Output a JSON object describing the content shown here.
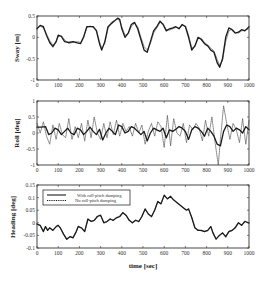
{
  "chart_data": [
    {
      "type": "line",
      "panel": "sway",
      "ylabel": "Sway  [m]",
      "xlabel": "",
      "xlim": [
        0,
        1000
      ],
      "ylim": [
        -1,
        0.5
      ],
      "xticks": [
        0,
        100,
        200,
        300,
        400,
        500,
        600,
        700,
        800,
        900,
        1000
      ],
      "yticks": [
        0.5,
        0,
        -0.5,
        -1
      ],
      "ytick_labels": [
        "0.5",
        "0",
        "-0.5",
        "-1"
      ],
      "grid": false,
      "series": [
        {
          "name": "With roll-pitch damping",
          "style": "solid",
          "x": [
            0,
            15,
            30,
            45,
            60,
            75,
            90,
            100,
            115,
            130,
            150,
            170,
            190,
            205,
            220,
            235,
            250,
            265,
            280,
            295,
            305,
            320,
            335,
            350,
            365,
            380,
            390,
            400,
            415,
            430,
            445,
            460,
            475,
            490,
            505,
            520,
            535,
            550,
            565,
            580,
            595,
            610,
            625,
            640,
            655,
            670,
            685,
            700,
            715,
            730,
            745,
            760,
            775,
            790,
            805,
            820,
            835,
            850,
            862,
            875,
            890,
            905,
            920,
            935,
            950,
            965,
            980,
            1000
          ],
          "y": [
            0.2,
            0.28,
            0.25,
            0.05,
            -0.12,
            -0.22,
            -0.1,
            0.05,
            0.02,
            -0.1,
            -0.12,
            -0.1,
            -0.13,
            -0.15,
            0.0,
            0.25,
            0.25,
            0.25,
            0.15,
            -0.15,
            -0.3,
            -0.1,
            0.25,
            0.32,
            0.38,
            0.45,
            0.42,
            0.2,
            0.0,
            0.1,
            0.3,
            0.35,
            0.2,
            -0.05,
            -0.3,
            -0.35,
            -0.1,
            0.15,
            0.25,
            0.38,
            0.3,
            0.15,
            0.2,
            0.22,
            0.25,
            0.2,
            0.3,
            0.25,
            0.0,
            -0.3,
            -0.2,
            0.0,
            -0.05,
            -0.15,
            -0.2,
            -0.3,
            -0.35,
            -0.6,
            -0.7,
            -0.5,
            0.0,
            0.22,
            0.18,
            0.1,
            0.12,
            0.18,
            0.15,
            0.25
          ]
        },
        {
          "name": "No roll-pitch damping",
          "style": "dotted",
          "x": [
            0,
            15,
            30,
            45,
            60,
            75,
            90,
            100,
            115,
            130,
            150,
            170,
            190,
            205,
            220,
            235,
            250,
            265,
            280,
            295,
            305,
            320,
            335,
            350,
            365,
            380,
            390,
            400,
            415,
            430,
            445,
            460,
            475,
            490,
            505,
            520,
            535,
            550,
            565,
            580,
            595,
            610,
            625,
            640,
            655,
            670,
            685,
            700,
            715,
            730,
            745,
            760,
            775,
            790,
            805,
            820,
            835,
            850,
            862,
            875,
            890,
            905,
            920,
            935,
            950,
            965,
            980,
            1000
          ],
          "y": [
            0.22,
            0.26,
            0.22,
            0.08,
            -0.08,
            -0.18,
            -0.12,
            0.02,
            0.04,
            -0.06,
            -0.14,
            -0.12,
            -0.1,
            -0.12,
            0.02,
            0.22,
            0.27,
            0.23,
            0.18,
            -0.1,
            -0.25,
            -0.15,
            0.2,
            0.35,
            0.4,
            0.42,
            0.4,
            0.25,
            0.05,
            0.08,
            0.25,
            0.33,
            0.25,
            0.0,
            -0.22,
            -0.3,
            -0.15,
            0.1,
            0.22,
            0.35,
            0.32,
            0.18,
            0.17,
            0.2,
            0.23,
            0.22,
            0.28,
            0.27,
            0.05,
            -0.25,
            -0.22,
            -0.03,
            -0.02,
            -0.12,
            -0.18,
            -0.25,
            -0.32,
            -0.52,
            -0.65,
            -0.55,
            -0.1,
            0.15,
            0.2,
            0.12,
            0.1,
            0.15,
            0.17,
            0.2
          ]
        }
      ]
    },
    {
      "type": "line",
      "panel": "roll",
      "ylabel": "Roll  [deg]",
      "xlabel": "",
      "xlim": [
        0,
        1000
      ],
      "ylim": [
        -1,
        1
      ],
      "xticks": [
        0,
        100,
        200,
        300,
        400,
        500,
        600,
        700,
        800,
        900,
        1000
      ],
      "yticks": [
        1,
        0.5,
        0,
        -0.5,
        -1
      ],
      "ytick_labels": [
        "1",
        "0.5",
        "0",
        "-0.5",
        "-1"
      ],
      "grid": false,
      "series": [
        {
          "name": "With roll-pitch damping",
          "style": "solid",
          "x": [
            0,
            20,
            40,
            55,
            70,
            85,
            100,
            115,
            130,
            145,
            160,
            175,
            190,
            205,
            220,
            235,
            250,
            265,
            280,
            295,
            310,
            325,
            340,
            355,
            370,
            385,
            400,
            415,
            430,
            445,
            460,
            475,
            490,
            505,
            520,
            535,
            550,
            565,
            580,
            595,
            610,
            625,
            640,
            655,
            670,
            685,
            700,
            715,
            730,
            745,
            760,
            775,
            790,
            805,
            820,
            835,
            850,
            865,
            880,
            895,
            910,
            925,
            940,
            955,
            970,
            985,
            1000
          ],
          "y": [
            0.18,
            0.18,
            0.2,
            -0.05,
            0.0,
            0.15,
            0.1,
            -0.05,
            0.05,
            0.15,
            0.0,
            -0.05,
            0.15,
            0.1,
            -0.05,
            0.05,
            0.18,
            0.05,
            -0.05,
            0.12,
            -0.22,
            0.0,
            0.15,
            0.05,
            -0.05,
            0.25,
            0.2,
            0.0,
            0.05,
            0.2,
            0.15,
            0.05,
            -0.05,
            0.05,
            -0.25,
            0.0,
            0.15,
            0.1,
            0.05,
            0.15,
            -0.15,
            0.1,
            0.05,
            0.12,
            0.2,
            0.15,
            0.05,
            -0.2,
            0.1,
            0.2,
            0.15,
            0.05,
            -0.1,
            0.15,
            0.05,
            -0.1,
            -0.35,
            -0.4,
            0.05,
            0.25,
            0.2,
            0.05,
            0.15,
            0.1,
            0.0,
            0.2,
            0.1
          ]
        },
        {
          "name": "No roll-pitch damping",
          "style": "dotted",
          "x": [
            0,
            15,
            30,
            45,
            60,
            75,
            90,
            105,
            120,
            135,
            150,
            165,
            180,
            195,
            210,
            225,
            240,
            255,
            270,
            285,
            300,
            315,
            330,
            345,
            360,
            375,
            390,
            405,
            420,
            435,
            450,
            465,
            480,
            495,
            510,
            525,
            540,
            555,
            570,
            585,
            600,
            615,
            630,
            645,
            660,
            675,
            690,
            705,
            720,
            735,
            750,
            765,
            780,
            795,
            810,
            825,
            840,
            855,
            865,
            880,
            895,
            910,
            925,
            940,
            955,
            970,
            985,
            1000
          ],
          "y": [
            0.3,
            0.0,
            0.35,
            -0.1,
            -0.35,
            0.25,
            -0.2,
            0.3,
            -0.05,
            -0.15,
            0.45,
            -0.2,
            0.2,
            -0.15,
            0.3,
            -0.25,
            0.4,
            -0.15,
            0.5,
            0.0,
            -0.2,
            0.3,
            -0.15,
            0.35,
            -0.05,
            0.4,
            -0.1,
            0.3,
            0.05,
            0.2,
            -0.1,
            0.3,
            0.0,
            0.25,
            -0.35,
            0.05,
            0.3,
            -0.1,
            0.35,
            0.2,
            -0.45,
            0.55,
            -0.4,
            0.45,
            0.0,
            -0.1,
            0.3,
            -0.3,
            0.25,
            0.1,
            0.3,
            0.15,
            -0.25,
            0.4,
            -0.1,
            0.5,
            -0.3,
            -1.0,
            -0.2,
            0.85,
            0.3,
            -0.2,
            0.3,
            0.1,
            -0.3,
            0.45,
            -0.35,
            0.4
          ]
        }
      ]
    },
    {
      "type": "line",
      "panel": "heading",
      "ylabel": "Heading  [deg]",
      "xlabel": "time  [sec]",
      "xlim": [
        0,
        1000
      ],
      "ylim": [
        -0.1,
        0.15
      ],
      "xticks": [
        0,
        100,
        200,
        300,
        400,
        500,
        600,
        700,
        800,
        900,
        1000
      ],
      "yticks": [
        0.15,
        0.1,
        0.05,
        0,
        -0.05,
        -0.1
      ],
      "ytick_labels": [
        "0.15",
        "0.1",
        "0.05",
        "0",
        "-0.05",
        "-0.1"
      ],
      "grid": false,
      "legend": {
        "position": "upper left",
        "entries": [
          "With roll-pitch damping",
          "No roll-pitch damping"
        ]
      },
      "series": [
        {
          "name": "With roll-pitch damping",
          "style": "solid",
          "x": [
            0,
            15,
            30,
            40,
            50,
            60,
            75,
            90,
            100,
            110,
            125,
            140,
            155,
            170,
            185,
            195,
            210,
            225,
            240,
            255,
            270,
            285,
            300,
            315,
            330,
            345,
            360,
            375,
            390,
            405,
            420,
            435,
            450,
            465,
            480,
            495,
            510,
            525,
            540,
            555,
            570,
            585,
            600,
            615,
            630,
            645,
            660,
            675,
            690,
            705,
            715,
            730,
            745,
            760,
            775,
            790,
            805,
            820,
            830,
            845,
            860,
            875,
            890,
            905,
            920,
            935,
            950,
            965,
            980,
            1000
          ],
          "y": [
            -0.005,
            -0.01,
            -0.035,
            -0.015,
            -0.03,
            -0.02,
            -0.03,
            -0.015,
            -0.01,
            -0.02,
            -0.045,
            -0.065,
            -0.055,
            -0.06,
            -0.035,
            -0.015,
            -0.02,
            -0.035,
            0.015,
            0.005,
            0.01,
            0.025,
            0.03,
            0.0,
            0.005,
            0.015,
            0.01,
            0.02,
            0.025,
            0.04,
            0.03,
            0.01,
            0.0,
            0.01,
            0.005,
            0.025,
            0.055,
            0.035,
            0.025,
            0.05,
            0.085,
            0.075,
            0.11,
            0.095,
            0.105,
            0.09,
            0.08,
            0.07,
            0.06,
            0.05,
            0.055,
            0.02,
            -0.02,
            -0.03,
            -0.03,
            -0.035,
            -0.03,
            -0.015,
            -0.04,
            -0.065,
            -0.05,
            -0.04,
            -0.055,
            -0.035,
            -0.03,
            -0.02,
            0.0,
            -0.01,
            0.005,
            0.0
          ]
        },
        {
          "name": "No roll-pitch damping",
          "style": "dotted",
          "x": [
            0,
            15,
            30,
            40,
            50,
            60,
            75,
            90,
            100,
            110,
            125,
            140,
            155,
            170,
            185,
            195,
            210,
            225,
            240,
            255,
            270,
            285,
            300,
            315,
            330,
            345,
            360,
            375,
            390,
            405,
            420,
            435,
            450,
            465,
            480,
            495,
            510,
            525,
            540,
            555,
            570,
            585,
            600,
            615,
            630,
            645,
            660,
            675,
            690,
            705,
            715,
            730,
            745,
            760,
            775,
            790,
            805,
            820,
            830,
            845,
            860,
            875,
            890,
            905,
            920,
            935,
            950,
            965,
            980,
            1000
          ],
          "y": [
            -0.004,
            -0.012,
            -0.033,
            -0.016,
            -0.028,
            -0.022,
            -0.028,
            -0.017,
            -0.009,
            -0.022,
            -0.043,
            -0.067,
            -0.053,
            -0.058,
            -0.037,
            -0.013,
            -0.022,
            -0.033,
            0.013,
            0.007,
            0.008,
            0.027,
            0.028,
            0.002,
            0.003,
            0.017,
            0.008,
            0.022,
            0.023,
            0.042,
            0.028,
            0.012,
            -0.002,
            0.012,
            0.003,
            0.027,
            0.053,
            0.037,
            0.023,
            0.052,
            0.083,
            0.077,
            0.108,
            0.097,
            0.103,
            0.092,
            0.078,
            0.072,
            0.058,
            0.052,
            0.053,
            0.022,
            -0.022,
            -0.028,
            -0.032,
            -0.033,
            -0.032,
            -0.013,
            -0.042,
            -0.063,
            -0.052,
            -0.038,
            -0.057,
            -0.033,
            -0.032,
            -0.018,
            0.002,
            -0.012,
            0.007,
            -0.002
          ]
        }
      ]
    }
  ],
  "figure": {
    "xtick_labels": [
      "0",
      "100",
      "200",
      "300",
      "400",
      "500",
      "600",
      "700",
      "800",
      "900",
      "1000"
    ],
    "shared_xlabel": "time  [sec]",
    "panels": {
      "sway": {
        "ylabel": "Sway  [m]"
      },
      "roll": {
        "ylabel": "Roll  [deg]"
      },
      "heading": {
        "ylabel": "Heading  [deg]"
      }
    },
    "legend": {
      "solid_label": "With roll-pitch damping",
      "dotted_label": "No roll-pitch damping"
    },
    "colors": {
      "solid": "#1a1a1a",
      "dotted": "#555555",
      "frame": "#333333"
    }
  }
}
